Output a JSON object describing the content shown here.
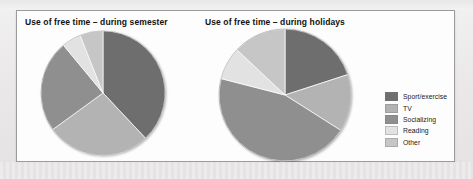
{
  "panel": {
    "background": "#fdfdfd",
    "border_color": "#9b9b9b"
  },
  "charts": [
    {
      "id": "semester",
      "title": "Use of free time – during semester"
    },
    {
      "id": "holidays",
      "title": "Use of free time – during holidays"
    }
  ],
  "legend": {
    "position": "right",
    "items": [
      {
        "label": "Sport/exercise",
        "color": "#6e6e6e"
      },
      {
        "label": "TV",
        "color": "#b3b3b3"
      },
      {
        "label": "Socializing",
        "color": "#8f8f8f"
      },
      {
        "label": "Reading",
        "color": "#e2e2e2"
      },
      {
        "label": "Other",
        "color": "#c6c6c6"
      }
    ]
  },
  "chart_data": [
    {
      "type": "pie",
      "title": "Use of free time – during semester",
      "categories": [
        "Sport/exercise",
        "TV",
        "Socializing",
        "Reading",
        "Other"
      ],
      "values": [
        38,
        27,
        24,
        5,
        6
      ],
      "unit": "percent",
      "colors": [
        "#6e6e6e",
        "#b3b3b3",
        "#8f8f8f",
        "#e2e2e2",
        "#c6c6c6"
      ],
      "start_angle_deg": 0,
      "direction": "clockwise",
      "legend": "shared-right",
      "labels_shown": false
    },
    {
      "type": "pie",
      "title": "Use of free time – during holidays",
      "categories": [
        "Sport/exercise",
        "TV",
        "Socializing",
        "Reading",
        "Other"
      ],
      "values": [
        20,
        14,
        45,
        8,
        13
      ],
      "unit": "percent",
      "colors": [
        "#6e6e6e",
        "#b3b3b3",
        "#8f8f8f",
        "#e2e2e2",
        "#c6c6c6"
      ],
      "start_angle_deg": 0,
      "direction": "clockwise",
      "legend": "shared-right",
      "labels_shown": false
    }
  ]
}
